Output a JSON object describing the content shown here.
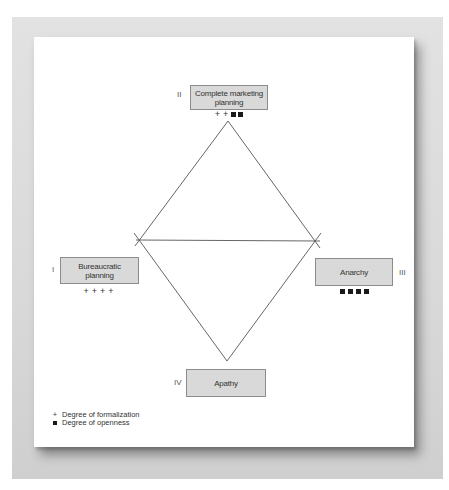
{
  "diagram": {
    "nodes": [
      {
        "id": "II",
        "roman": "II",
        "label": "Complete marketing planning",
        "label_lines": [
          "Complete marketing",
          "planning"
        ],
        "symbols": [
          "+",
          "+",
          "■",
          "■"
        ],
        "position": "top"
      },
      {
        "id": "I",
        "roman": "I",
        "label": "Bureaucratic planning",
        "label_lines": [
          "Bureaucratic",
          "planning"
        ],
        "symbols": [
          "+",
          "+",
          "+",
          "+"
        ],
        "position": "left"
      },
      {
        "id": "III",
        "roman": "III",
        "label": "Anarchy",
        "label_lines": [
          "Anarchy"
        ],
        "symbols": [
          "■",
          "■",
          "■",
          "■"
        ],
        "position": "right"
      },
      {
        "id": "IV",
        "roman": "IV",
        "label": "Apathy",
        "label_lines": [
          "Apathy"
        ],
        "symbols": [],
        "position": "bottom"
      }
    ],
    "edges": [
      {
        "from": "top-vertex",
        "to": "left-vertex"
      },
      {
        "from": "top-vertex",
        "to": "right-vertex"
      },
      {
        "from": "left-vertex",
        "to": "bottom-vertex"
      },
      {
        "from": "right-vertex",
        "to": "bottom-vertex"
      },
      {
        "from": "left-vertex",
        "to": "right-vertex"
      }
    ],
    "legend": [
      {
        "marker": "+",
        "label": "Degree of formalization"
      },
      {
        "marker": "■",
        "label": "Degree of openness"
      }
    ],
    "colors": {
      "box_fill": "#d9d9d9",
      "box_border": "#8c8c8c",
      "line": "#555555",
      "frame": "#dcdcdc"
    }
  }
}
